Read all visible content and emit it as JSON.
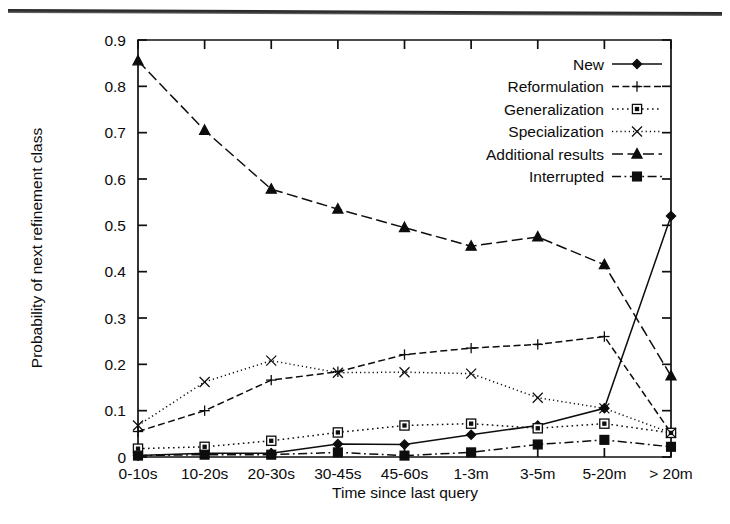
{
  "figure": {
    "name": "probability-of-next-refinement-class-by-time-since-last-query",
    "background": "#ffffff",
    "ink_color": "#0d0d0d"
  },
  "chart_data": {
    "type": "line",
    "title": "",
    "xlabel": "Time since last query",
    "ylabel": "Probability of next refinement class",
    "categories": [
      "0-10s",
      "10-20s",
      "20-30s",
      "30-45s",
      "45-60s",
      "1-3m",
      "3-5m",
      "5-20m",
      "> 20m"
    ],
    "ylim": [
      0,
      0.9
    ],
    "ytick_labels": [
      "0",
      "0.1",
      "0.2",
      "0.3",
      "0.4",
      "0.5",
      "0.6",
      "0.7",
      "0.8",
      "0.9"
    ],
    "ytick_values": [
      0,
      0.1,
      0.2,
      0.3,
      0.4,
      0.5,
      0.6,
      0.7,
      0.8,
      0.9
    ],
    "grid": false,
    "legend_position": "top-right inside plot area",
    "series": [
      {
        "name": "New",
        "marker": "filled-diamond",
        "dash": "solid",
        "values": [
          0.003,
          0.008,
          0.008,
          0.028,
          0.027,
          0.048,
          0.068,
          0.105,
          0.52
        ]
      },
      {
        "name": "Reformulation",
        "marker": "plus",
        "dash": "dashed",
        "values": [
          0.055,
          0.1,
          0.166,
          0.184,
          0.221,
          0.235,
          0.243,
          0.26,
          0.052
        ]
      },
      {
        "name": "Generalization",
        "marker": "open-square",
        "dash": "dotted",
        "values": [
          0.018,
          0.022,
          0.035,
          0.053,
          0.068,
          0.072,
          0.062,
          0.072,
          0.052
        ]
      },
      {
        "name": "Specialization",
        "marker": "cross-x",
        "dash": "fine-dotted",
        "values": [
          0.068,
          0.162,
          0.208,
          0.182,
          0.183,
          0.18,
          0.128,
          0.105,
          0.052
        ]
      },
      {
        "name": "Additional results",
        "marker": "filled-triangle",
        "dash": "long-dash",
        "values": [
          0.855,
          0.705,
          0.578,
          0.535,
          0.495,
          0.455,
          0.475,
          0.415,
          0.175
        ]
      },
      {
        "name": "Interrupted",
        "marker": "filled-square",
        "dash": "dash-dot",
        "values": [
          0.003,
          0.005,
          0.005,
          0.01,
          0.003,
          0.01,
          0.027,
          0.037,
          0.022
        ]
      }
    ]
  }
}
